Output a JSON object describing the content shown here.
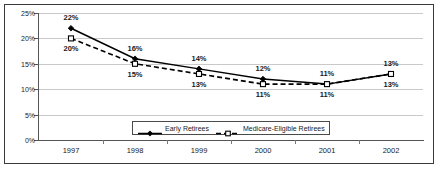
{
  "chart_data": {
    "type": "line",
    "title": "",
    "subtitle": "",
    "xlabel": "",
    "ylabel": "",
    "categories": [
      "1997",
      "1998",
      "1999",
      "2000",
      "2001",
      "2002"
    ],
    "series": [
      {
        "name": "Early Retirees",
        "values": [
          22,
          16,
          14,
          12,
          11,
          13
        ],
        "value_labels": [
          "22%",
          "16%",
          "14%",
          "12%",
          "11%",
          "13%"
        ],
        "line_style": "solid",
        "marker": "filled-diamond",
        "color": "#000000",
        "label_position": "above"
      },
      {
        "name": "Medicare-Eligible Retirees",
        "values": [
          20,
          15,
          13,
          11,
          11,
          13
        ],
        "value_labels": [
          "20%",
          "15%",
          "13%",
          "11%",
          "11%",
          "13%"
        ],
        "line_style": "dashed",
        "marker": "open-square",
        "color": "#000000",
        "label_position": "below"
      }
    ],
    "ylim": [
      0,
      25
    ],
    "yticks": [
      0,
      5,
      10,
      15,
      20,
      25
    ],
    "ytick_labels": [
      "0%",
      "5%",
      "10%",
      "15%",
      "20%",
      "25%"
    ],
    "grid": true,
    "grid_axis": "y",
    "grid_color": "#c9c9c9",
    "legend_position": "bottom-center",
    "border_color": "#3a3a3a",
    "background_color": "#ffffff"
  },
  "legend": {
    "entries": [
      {
        "label": "Early Retirees"
      },
      {
        "label": "Medicare-Eligible Retirees"
      }
    ]
  }
}
